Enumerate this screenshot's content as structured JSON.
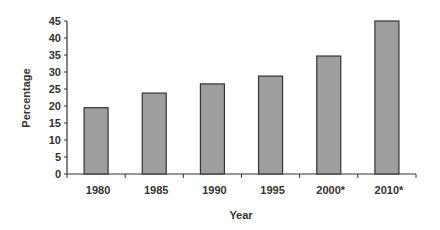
{
  "chart_data": {
    "type": "bar",
    "title": "",
    "xlabel": "Year",
    "ylabel": "Percentage",
    "categories": [
      "1980",
      "1985",
      "1990",
      "1995",
      "2000*",
      "2010*"
    ],
    "values": [
      19.5,
      23.8,
      26.5,
      28.8,
      34.7,
      45
    ],
    "ylim": [
      0,
      45
    ],
    "yticks": [
      0,
      5,
      10,
      15,
      20,
      25,
      30,
      35,
      40,
      45
    ],
    "grid": false,
    "legend": null,
    "bar_color": "#9e9e9e",
    "bar_edge_color": "#333333"
  }
}
